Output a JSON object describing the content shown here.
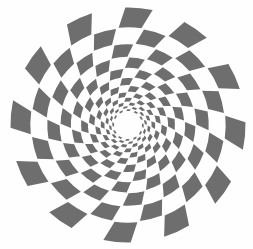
{
  "figure": {
    "title": "Logarithmic spiral checkerboard",
    "background_color": "#fefefe",
    "dark_color": "#6e6e6e",
    "light_color": "#fdfdfd",
    "canvas": {
      "width": 253,
      "height": 249
    }
  },
  "chart_data": {
    "type": "scatter",
    "title": "Logarithmic spiral checkerboard",
    "subtitle": "",
    "xlabel": "",
    "ylabel": "",
    "grid": false,
    "legend": false,
    "center": {
      "x": 128,
      "y": 125
    },
    "inner_radius": 13.5,
    "outer_radius": 118,
    "sectors": 24,
    "rings": 13,
    "growth_ratio": 1.1965,
    "twist_per_ring_deg": 4.2,
    "sector_gap_deg": 1.6,
    "ring_gap_px": 0.9,
    "ring_radii": [
      13.5,
      16.2,
      19.3,
      23.1,
      27.7,
      33.1,
      39.6,
      47.4,
      56.7,
      67.9,
      81.2,
      97.2,
      118.0
    ],
    "ring_labels": [
      "r0",
      "r1",
      "r2",
      "r3",
      "r4",
      "r5",
      "r6",
      "r7",
      "r8",
      "r9",
      "r10",
      "r11",
      "r12"
    ],
    "parity_start": 0,
    "colors": {
      "dark": "#6e6e6e",
      "light": "#fdfdfd",
      "background": "#fefefe"
    },
    "xlim": [
      0,
      253
    ],
    "ylim": [
      0,
      249
    ]
  }
}
